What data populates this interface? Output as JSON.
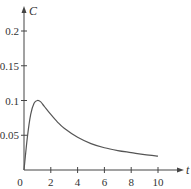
{
  "chart_data": {
    "type": "line",
    "title": "",
    "xlabel": "t",
    "ylabel": "C",
    "xlim": [
      0,
      10
    ],
    "ylim": [
      0,
      0.2
    ],
    "x_ticks": [
      0,
      2,
      4,
      6,
      8,
      10
    ],
    "x_tick_labels": [
      "0",
      "2",
      "4",
      "6",
      "8",
      "10"
    ],
    "y_ticks": [
      0.05,
      0.1,
      0.15,
      0.2
    ],
    "y_tick_labels": [
      "0.05",
      "0.1",
      "0.15",
      "0.2"
    ],
    "grid": false,
    "legend": null,
    "series": [
      {
        "name": "C(t)",
        "x": [
          0,
          0.25,
          0.5,
          0.75,
          1,
          1.25,
          1.5,
          2,
          2.5,
          3,
          4,
          5,
          6,
          7,
          8,
          9,
          10
        ],
        "values": [
          0,
          0.047,
          0.08,
          0.096,
          0.1,
          0.098,
          0.092,
          0.08,
          0.069,
          0.06,
          0.047,
          0.038,
          0.032,
          0.028,
          0.025,
          0.022,
          0.02
        ]
      }
    ]
  }
}
